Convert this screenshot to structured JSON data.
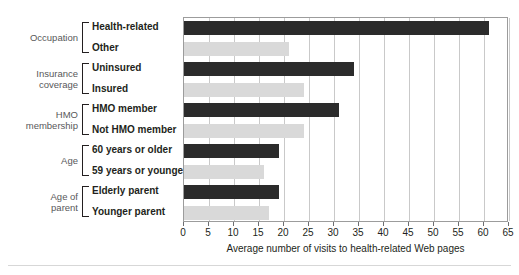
{
  "chart_data": {
    "type": "bar",
    "orientation": "horizontal",
    "title": "",
    "xlabel": "Average number of visits to health-related Web pages",
    "ylabel": "",
    "xlim": [
      0,
      65
    ],
    "xticks": [
      0,
      5,
      10,
      15,
      20,
      25,
      30,
      35,
      40,
      45,
      50,
      55,
      60,
      65
    ],
    "grid": "vertical",
    "legend": "none",
    "colors": {
      "dark": "#2b2b2b",
      "light": "#d9d9d9",
      "grid": "#c9c9c9",
      "border": "#9c9c9c"
    },
    "groups": [
      {
        "name": "Occupation",
        "categories": [
          "Health-related",
          "Other"
        ],
        "values": [
          61,
          21
        ],
        "styles": [
          "dark",
          "light"
        ]
      },
      {
        "name": "Insurance coverage",
        "name_lines": [
          "Insurance",
          "coverage"
        ],
        "categories": [
          "Uninsured",
          "Insured"
        ],
        "values": [
          34,
          24
        ],
        "styles": [
          "dark",
          "light"
        ]
      },
      {
        "name": "HMO membership",
        "name_lines": [
          "HMO",
          "membership"
        ],
        "categories": [
          "HMO member",
          "Not HMO member"
        ],
        "values": [
          31,
          24
        ],
        "styles": [
          "dark",
          "light"
        ]
      },
      {
        "name": "Age",
        "name_lines": [
          "Age"
        ],
        "categories": [
          "60 years or older",
          "59 years or younger"
        ],
        "values": [
          19,
          16
        ],
        "styles": [
          "dark",
          "light"
        ]
      },
      {
        "name": "Age of parent",
        "name_lines": [
          "Age of",
          "parent"
        ],
        "categories": [
          "Elderly parent",
          "Younger parent"
        ],
        "values": [
          19,
          17
        ],
        "styles": [
          "dark",
          "light"
        ]
      }
    ]
  }
}
